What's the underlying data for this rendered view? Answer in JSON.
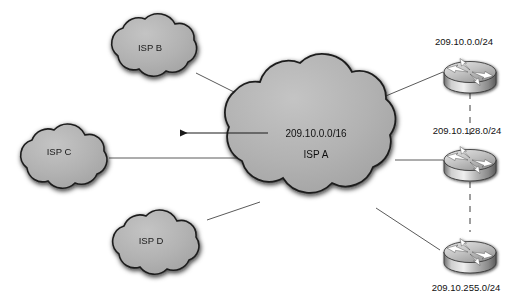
{
  "diagram": {
    "type": "network-topology",
    "background_color": "#ffffff",
    "cloud_fill": "#b4b4b4",
    "cloud_edge": "#1c1c1c",
    "router_fill": "#b0b0b0",
    "line_color": "#555555",
    "dashed_line_color": "#9a9a9a",
    "arrow_color": "#1a1a1a"
  },
  "center_cloud": {
    "name": "isp-a-cloud",
    "network": "209.10.0.0/16",
    "label": "ISP A"
  },
  "peer_clouds": [
    {
      "name": "isp-b-cloud",
      "label": "ISP B"
    },
    {
      "name": "isp-c-cloud",
      "label": "ISP C"
    },
    {
      "name": "isp-d-cloud",
      "label": "ISP D"
    }
  ],
  "routers": [
    {
      "name": "router-top",
      "label": "209.10.0.0/24"
    },
    {
      "name": "router-middle",
      "label": "209.10.128.0/24"
    },
    {
      "name": "router-bottom",
      "label": "209.10.255.0/24"
    }
  ],
  "annotations": {
    "advertised_route_arrow": "209.10.0.0/16"
  }
}
